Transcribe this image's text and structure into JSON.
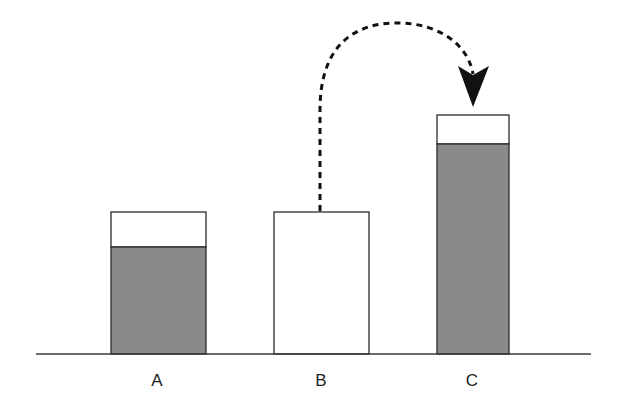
{
  "diagram": {
    "type": "bar-transfer-diagram",
    "baseline": {
      "x1": 36,
      "x2": 591,
      "y": 354,
      "color": "#3a3a3a"
    },
    "colors": {
      "fill_filled": "#8a8a8a",
      "fill_empty": "#ffffff",
      "stroke": "#2a2a2a",
      "arrow": "#111111"
    },
    "bars": [
      {
        "id": "A",
        "label": "A",
        "x": 111,
        "width": 95,
        "top": 212,
        "fill_top": 247,
        "label_x": 157
      },
      {
        "id": "B",
        "label": "B",
        "x": 274,
        "width": 95,
        "top": 212,
        "fill_top": null,
        "label_x": 321
      },
      {
        "id": "C",
        "label": "C",
        "x": 437,
        "width": 72,
        "top": 115,
        "fill_top": 144,
        "label_x": 472
      }
    ],
    "label_y": 386,
    "arrow": {
      "from": "B",
      "to": "C",
      "style": "dashed",
      "description": "dashed curved arrow from top of bar B over to top of bar C"
    }
  }
}
